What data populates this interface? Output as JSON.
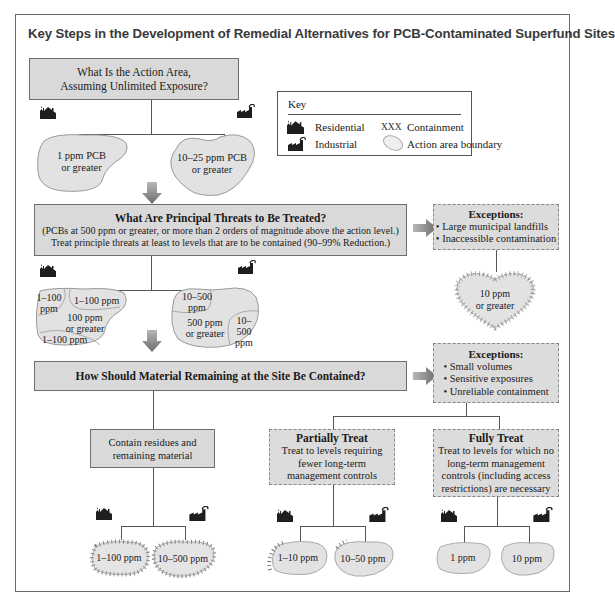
{
  "title": "Key Steps in the Development of Remedial Alternatives for PCB-Contaminated Superfund Sites",
  "key": {
    "heading": "Key",
    "items": [
      {
        "icon": "residential-house-icon",
        "label": "Residential"
      },
      {
        "icon": "containment-xxx-icon",
        "symbol": "XXX",
        "label": "Containment"
      },
      {
        "icon": "industrial-factory-icon",
        "label": "Industrial"
      },
      {
        "icon": "action-area-boundary-icon",
        "label": "Action area boundary"
      }
    ]
  },
  "step1": {
    "line1": "What Is the Action Area,",
    "line2": "Assuming Unlimited Exposure?",
    "residential_area": {
      "line1": "1 ppm PCB",
      "line2": "or greater"
    },
    "industrial_area": {
      "line1": "10–25 ppm PCB",
      "line2": "or greater"
    }
  },
  "step2": {
    "heading": "What Are Principal Threats to Be Treated?",
    "line2": "(PCBs at 500 ppm or greater, or more than 2 orders of magnitude above the action level.)",
    "line3": "Treat principle threats at least to levels that are to be contained (90–99% Reduction.)",
    "residential_zones": [
      "1–100 ppm",
      "1–100 ppm",
      "100 ppm or greater",
      "1–100 ppm"
    ],
    "residential_zone_a": {
      "l1": "1–100",
      "l2": "ppm"
    },
    "residential_zone_b": "1–100 ppm",
    "residential_zone_c": {
      "l1": "100 ppm",
      "l2": "or greater"
    },
    "residential_zone_d": "1–100 ppm",
    "industrial_zone_a": {
      "l1": "10–500",
      "l2": "ppm"
    },
    "industrial_zone_b": {
      "l1": "500 ppm",
      "l2": "or greater"
    },
    "industrial_zone_c": {
      "l1": "10–500",
      "l2": "ppm"
    },
    "exceptions": {
      "heading": "Exceptions:",
      "items": [
        "• Large municipal landfills",
        "• Inaccessible contamination"
      ],
      "area": {
        "line1": "10 ppm",
        "line2": "or greater"
      }
    }
  },
  "step3": {
    "heading": "How Should Material Remaining at the Site Be Contained?",
    "exceptions": {
      "heading": "Exceptions:",
      "items": [
        "• Small volumes",
        "• Sensitive exposures",
        "• Unreliable containment"
      ]
    },
    "contain": {
      "line1": "Contain residues and",
      "line2": "remaining material",
      "residential_area": "1–100 ppm",
      "industrial_area": "10–500 ppm"
    },
    "partial": {
      "heading": "Partially Treat",
      "line1": "Treat to levels requiring",
      "line2": "fewer long-term",
      "line3": "management controls",
      "residential_area": "1–10 ppm",
      "industrial_area": "10–50 ppm"
    },
    "full": {
      "heading": "Fully Treat",
      "line1": "Treat to levels for which no",
      "line2": "long-term management",
      "line3": "controls (including access",
      "line4": "restrictions) are necessary",
      "residential_area": "1 ppm",
      "industrial_area": "10 ppm"
    }
  },
  "colors": {
    "box_fill": "#d9d9d9",
    "blob_fill": "#e2e2e2",
    "arrow": "#8c8c8c",
    "border": "#6e6e6e",
    "title": "#3a3a3a"
  }
}
